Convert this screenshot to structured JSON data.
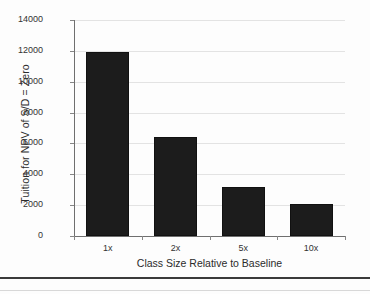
{
  "chart_data": {
    "type": "bar",
    "title": "",
    "xlabel": "Class Size Relative to Baseline",
    "ylabel": "Tuition for NPV of S/D = Zero",
    "categories": [
      "1x",
      "2x",
      "5x",
      "10x"
    ],
    "values": [
      11900,
      6430,
      3150,
      2050
    ],
    "ylim": [
      0,
      14000
    ],
    "yticks": [
      0,
      2000,
      4000,
      6000,
      8000,
      10000,
      12000,
      14000
    ],
    "ytick_labels": [
      "0",
      "2000",
      "4000",
      "6000",
      "8000",
      "10000",
      "12000",
      "14000"
    ],
    "grid": true,
    "grid_axis": "y",
    "legend": false,
    "bar_color": "#1c1c1c",
    "gridline_color": "#e3e3e3",
    "axis_color": "#6f6f6f",
    "background_color": "#fdfdfd"
  }
}
